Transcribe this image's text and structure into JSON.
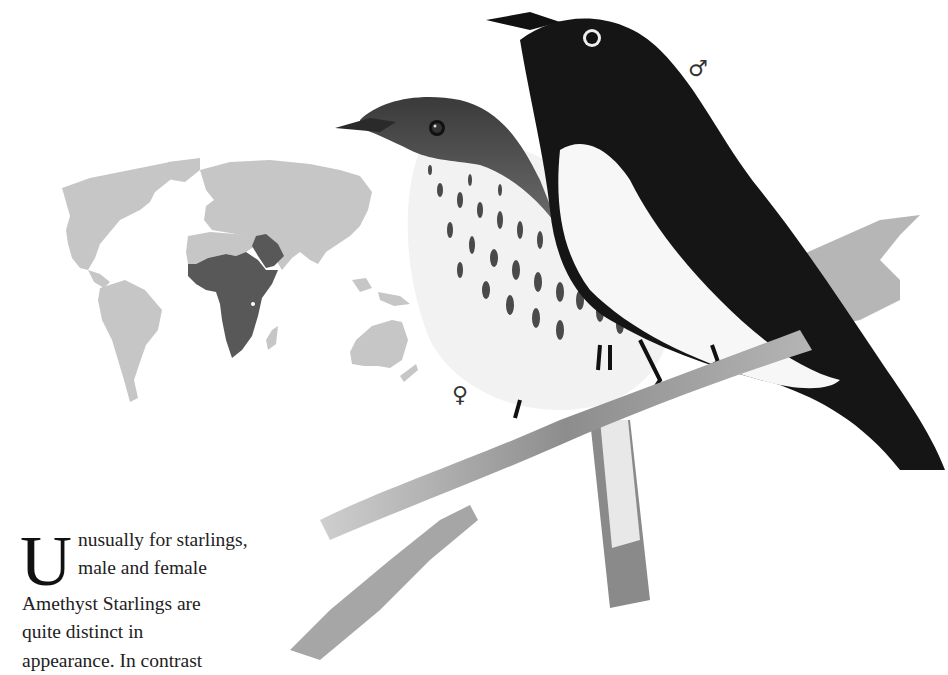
{
  "illustration": {
    "subject": "Amethyst Starling pair perched on a branch",
    "male_symbol": "♂",
    "female_symbol": "♀",
    "colors": {
      "male_plumage": "#141414",
      "male_breast": "#f6f6f6",
      "female_streaks": "#4a4a4a",
      "branch": "#9a9a9a"
    }
  },
  "range_map": {
    "description": "World map with breeding range highlighted",
    "colors": {
      "land": "#c4c4c4",
      "range": "#575757",
      "ocean": "#ffffff"
    },
    "highlighted_regions": [
      "Sub-Saharan Africa",
      "Southwestern Arabian Peninsula"
    ]
  },
  "body_text": {
    "dropcap": "U",
    "lines": [
      "nusually for starlings,",
      "male and female",
      "Amethyst Starlings are",
      "quite distinct in",
      "appearance. In contrast"
    ]
  }
}
